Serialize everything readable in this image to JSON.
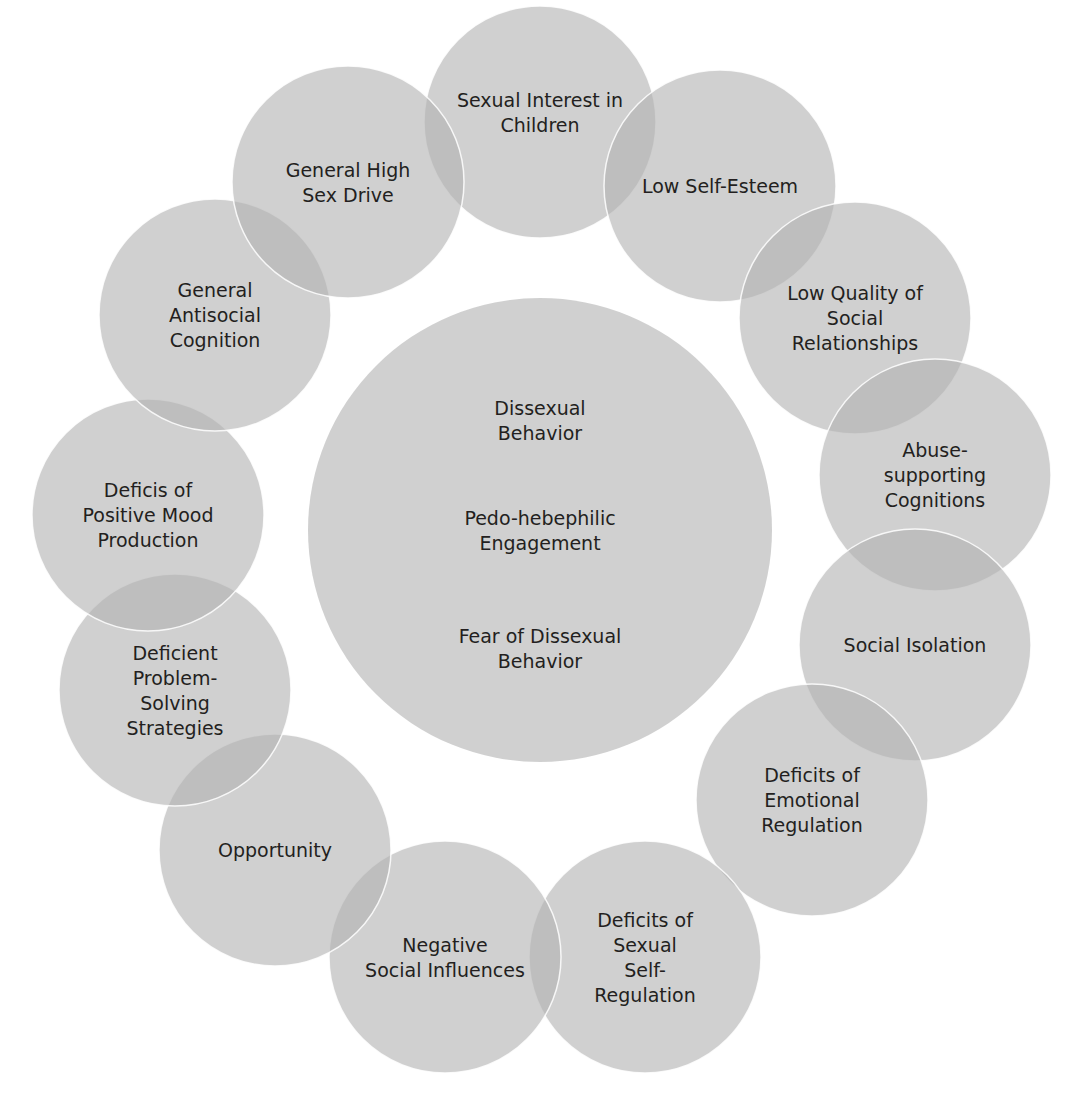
{
  "diagram": {
    "title": "",
    "center": {
      "label_groups": [
        [
          "Dissexual",
          "Behavior"
        ],
        [
          "Pedo-hebephilic",
          "Engagement"
        ],
        [
          "Fear of Dissexual",
          "Behavior"
        ]
      ]
    },
    "factors": [
      {
        "id": "sexual-interest-in-children",
        "lines": [
          "Sexual Interest in",
          "Children"
        ]
      },
      {
        "id": "low-self-esteem",
        "lines": [
          "Low Self-Esteem"
        ]
      },
      {
        "id": "low-quality-social-relationships",
        "lines": [
          "Low Quality of",
          "Social",
          "Relationships"
        ]
      },
      {
        "id": "abuse-supporting-cognitions",
        "lines": [
          "Abuse-",
          "supporting",
          "Cognitions"
        ]
      },
      {
        "id": "social-isolation",
        "lines": [
          "Social Isolation"
        ]
      },
      {
        "id": "deficits-emotional-regulation",
        "lines": [
          "Deficits of",
          "Emotional",
          "Regulation"
        ]
      },
      {
        "id": "deficits-sexual-self-regulation",
        "lines": [
          "Deficits of",
          "Sexual",
          "Self-",
          "Regulation"
        ]
      },
      {
        "id": "negative-social-influences",
        "lines": [
          "Negative",
          "Social Influences"
        ]
      },
      {
        "id": "opportunity",
        "lines": [
          "Opportunity"
        ]
      },
      {
        "id": "deficient-problem-solving",
        "lines": [
          "Deficient",
          "Problem-",
          "Solving",
          "Strategies"
        ]
      },
      {
        "id": "deficits-positive-mood",
        "lines": [
          "Deficis of",
          "Positive Mood",
          "Production"
        ]
      },
      {
        "id": "general-antisocial-cognition",
        "lines": [
          "General",
          "Antisocial",
          "Cognition"
        ]
      },
      {
        "id": "general-high-sex-drive",
        "lines": [
          "General High",
          "Sex Drive"
        ]
      }
    ],
    "colors": {
      "circle_fill": "#b3b3b3",
      "text": "#231f20",
      "background": "#ffffff"
    }
  }
}
